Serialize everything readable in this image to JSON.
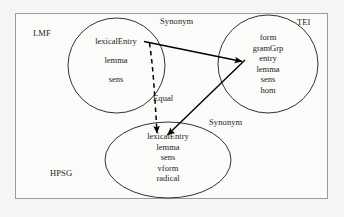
{
  "figure": {
    "zones": [
      {
        "id": "lmf",
        "label": "LMF",
        "shape": "circle"
      },
      {
        "id": "tei",
        "label": "TEI",
        "shape": "circle"
      },
      {
        "id": "hpsg",
        "label": "HPSG",
        "shape": "ellipse"
      }
    ],
    "sets": {
      "lmf": {
        "name": "LMF",
        "members": [
          "lexicalEntry",
          "lemma",
          "sens"
        ]
      },
      "tei": {
        "name": "TEI",
        "members": [
          "form",
          "gramGrp",
          "entry",
          "lemma",
          "sens",
          "hom"
        ]
      },
      "hpsg": {
        "name": "HPSG",
        "members": [
          "lexicalEntry",
          "lemma",
          "sens",
          "vform",
          "radical"
        ]
      }
    },
    "relations": [
      {
        "id": "synonym-lmf-tei",
        "label": "Synonym",
        "style": "solid",
        "from": "lmf.lexicalEntry",
        "to": "tei.entry"
      },
      {
        "id": "synonym-tei-hpsg",
        "label": "Synonym",
        "style": "solid",
        "from": "tei.entry",
        "to": "hpsg.lexicalEntry"
      },
      {
        "id": "equal-lmf-hpsg",
        "label": "Equal",
        "style": "dashed",
        "from": "lmf.lexicalEntry",
        "to": "hpsg.lexicalEntry"
      }
    ],
    "colors": {
      "background": "#f6f5f3",
      "panel": "#fbfbfa",
      "frame_border": "#9a9a9a",
      "shape_stroke": "#1b1b1b",
      "arrow": "#000000",
      "text": "#1b1b1b"
    }
  }
}
